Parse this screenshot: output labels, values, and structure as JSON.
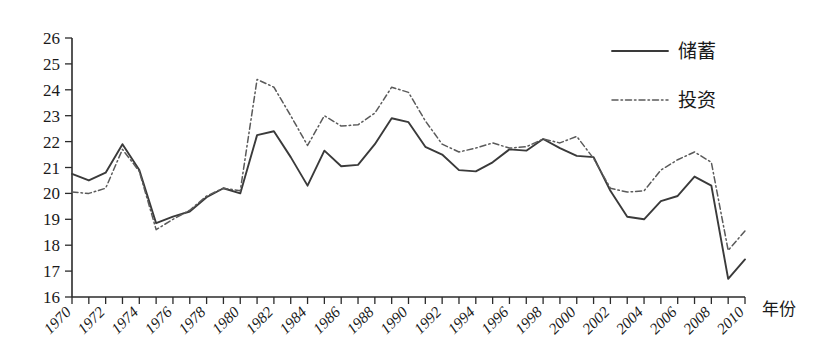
{
  "chart_data": {
    "type": "line",
    "title": "",
    "xlabel": "年份",
    "ylabel": "",
    "xlim": [
      1970,
      2010
    ],
    "ylim": [
      16,
      26
    ],
    "grid": false,
    "legend_position": "top-right",
    "x": [
      1970,
      1971,
      1972,
      1973,
      1974,
      1975,
      1976,
      1977,
      1978,
      1979,
      1980,
      1981,
      1982,
      1983,
      1984,
      1985,
      1986,
      1987,
      1988,
      1989,
      1990,
      1991,
      1992,
      1993,
      1994,
      1995,
      1996,
      1997,
      1998,
      1999,
      2000,
      2001,
      2002,
      2003,
      2004,
      2005,
      2006,
      2007,
      2008,
      2009,
      2010
    ],
    "xtick_labels": [
      "1970",
      "1972",
      "1974",
      "1976",
      "1978",
      "1980",
      "1982",
      "1984",
      "1986",
      "1988",
      "1990",
      "1992",
      "1994",
      "1996",
      "1998",
      "2000",
      "2002",
      "2004",
      "2006",
      "2008",
      "2010"
    ],
    "ytick_labels": [
      "16",
      "17",
      "18",
      "19",
      "20",
      "21",
      "22",
      "23",
      "24",
      "25",
      "26"
    ],
    "series": [
      {
        "name": "储蓄",
        "style": "solid",
        "color": "#3a3a3a",
        "values": [
          20.75,
          20.5,
          20.8,
          21.9,
          20.9,
          18.85,
          19.1,
          19.3,
          19.85,
          20.2,
          20.0,
          22.25,
          22.4,
          21.4,
          20.3,
          21.65,
          21.05,
          21.1,
          21.9,
          22.9,
          22.75,
          21.8,
          21.5,
          20.9,
          20.85,
          21.2,
          21.7,
          21.65,
          22.1,
          21.75,
          21.45,
          21.4,
          20.1,
          19.1,
          19.0,
          19.7,
          19.9,
          20.65,
          20.3,
          16.7,
          17.45
        ]
      },
      {
        "name": "投资",
        "style": "dashdot",
        "color": "#5a5a5a",
        "values": [
          20.05,
          20.0,
          20.2,
          21.7,
          20.85,
          18.6,
          19.0,
          19.35,
          19.9,
          20.2,
          20.1,
          24.4,
          24.1,
          23.0,
          21.85,
          23.0,
          22.6,
          22.65,
          23.1,
          24.1,
          23.9,
          22.8,
          21.9,
          21.6,
          21.75,
          21.95,
          21.75,
          21.8,
          22.1,
          21.95,
          22.2,
          21.35,
          20.2,
          20.05,
          20.1,
          20.9,
          21.3,
          21.6,
          21.2,
          17.8,
          18.55
        ]
      }
    ]
  },
  "legend": {
    "items": [
      {
        "label": "储蓄",
        "style": "solid"
      },
      {
        "label": "投资",
        "style": "dashdot"
      }
    ]
  },
  "axes": {
    "x_title": "年份"
  }
}
